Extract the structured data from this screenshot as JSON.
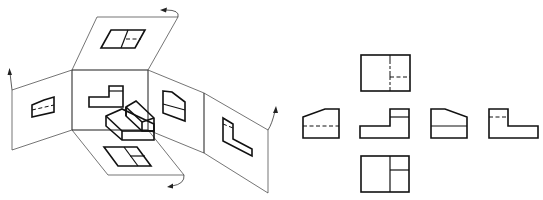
{
  "figure": {
    "title": "Six basic views projection (unfolding of the projection box)",
    "left_diagram": {
      "name": "Projection planes unfolding around an object",
      "panels": [
        "top",
        "front",
        "left",
        "right",
        "rear",
        "bottom"
      ]
    },
    "right_diagram": {
      "name": "Arrangement of six basic orthographic views",
      "views": [
        {
          "id": "top",
          "position": "above front"
        },
        {
          "id": "right-side",
          "position": "left of front"
        },
        {
          "id": "front",
          "position": "center"
        },
        {
          "id": "left-side",
          "position": "right of front"
        },
        {
          "id": "rear",
          "position": "far right"
        },
        {
          "id": "bottom",
          "position": "below front"
        }
      ]
    },
    "colors": {
      "background": "#ffffff",
      "line": "#111111",
      "frame_line": "#3a3a3a"
    }
  }
}
